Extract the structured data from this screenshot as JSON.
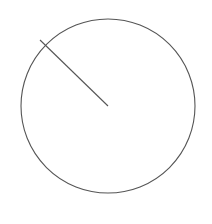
{
  "diagram": {
    "background": "#ffffff",
    "stroke_color": "#555555",
    "stroke_width": 1.1,
    "circle": {
      "cx": 108,
      "cy": 106,
      "r": 87
    },
    "radius_line": {
      "x1": 40,
      "y1": 40,
      "x2": 108,
      "y2": 106
    }
  }
}
